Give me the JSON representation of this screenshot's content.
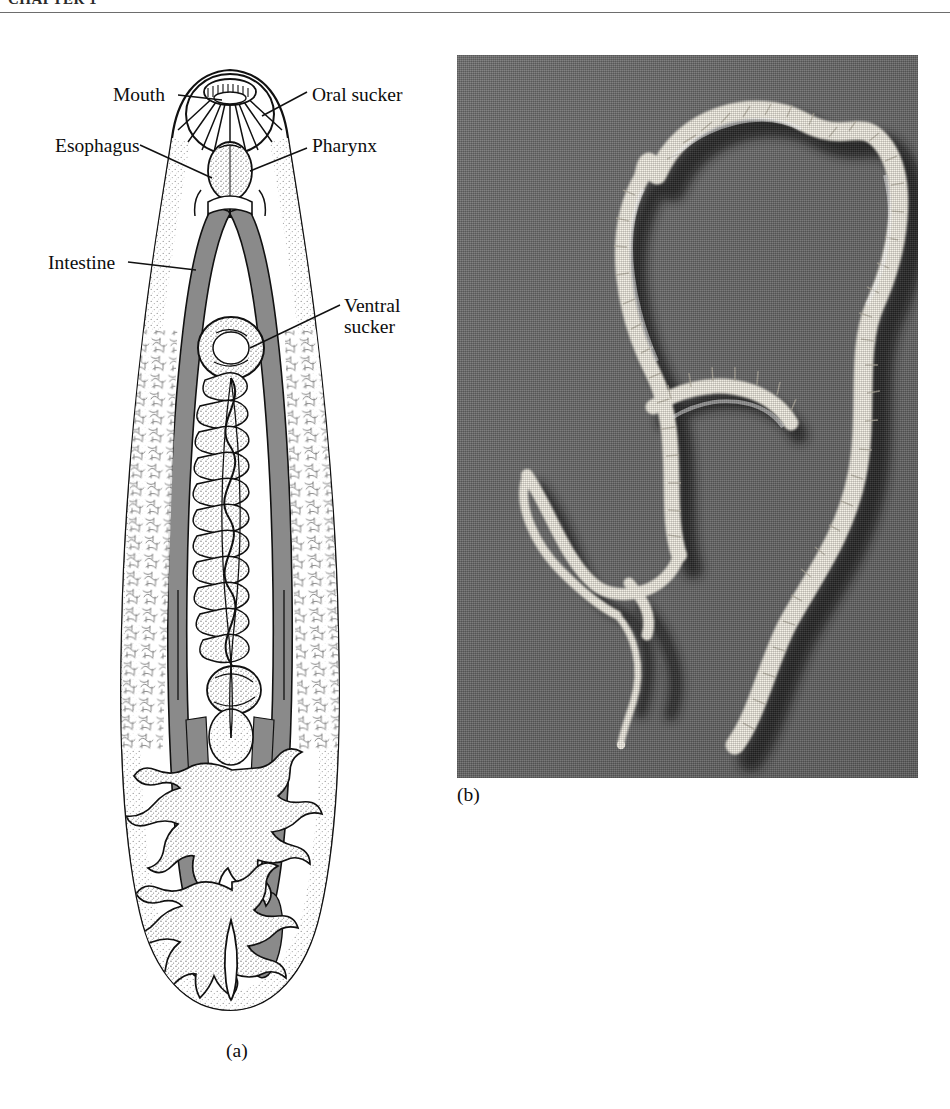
{
  "page": {
    "running_head": "CHAPTER 1",
    "background_color": "#ffffff",
    "width": 950,
    "height": 1109
  },
  "figure": {
    "panel_a": {
      "caption": "(a)",
      "type": "labeled anatomical line drawing",
      "subject": "liver fluke (trematode) internal anatomy, ventral view",
      "style": {
        "line_color": "#111111",
        "fill_color": "#ffffff",
        "intestine_color": "#8a8a8a",
        "stipple_color": "#9a9a9a"
      },
      "labels": [
        {
          "id": "mouth",
          "text": "Mouth",
          "side": "left"
        },
        {
          "id": "oral-sucker",
          "text": "Oral sucker",
          "side": "right"
        },
        {
          "id": "esophagus",
          "text": "Esophagus",
          "side": "left"
        },
        {
          "id": "pharynx",
          "text": "Pharynx",
          "side": "right"
        },
        {
          "id": "intestine",
          "text": "Intestine",
          "side": "left"
        },
        {
          "id": "ventral-sucker",
          "text": "Ventral\nsucker",
          "side": "right"
        }
      ],
      "label_texts": {
        "mouth": "Mouth",
        "oral_sucker": "Oral sucker",
        "esophagus": "Esophagus",
        "pharynx": "Pharynx",
        "intestine": "Intestine",
        "ventral_sucker_line1": "Ventral",
        "ventral_sucker_line2": "sucker"
      }
    },
    "panel_b": {
      "caption": "(b)",
      "type": "halftone photograph",
      "subject": "segmented tapeworm specimen coiled on a plain gray background",
      "style": {
        "background_color": "#6e6e6e",
        "specimen_color": "#f2efe6",
        "shadow_color": "#1e1e1e"
      }
    }
  }
}
